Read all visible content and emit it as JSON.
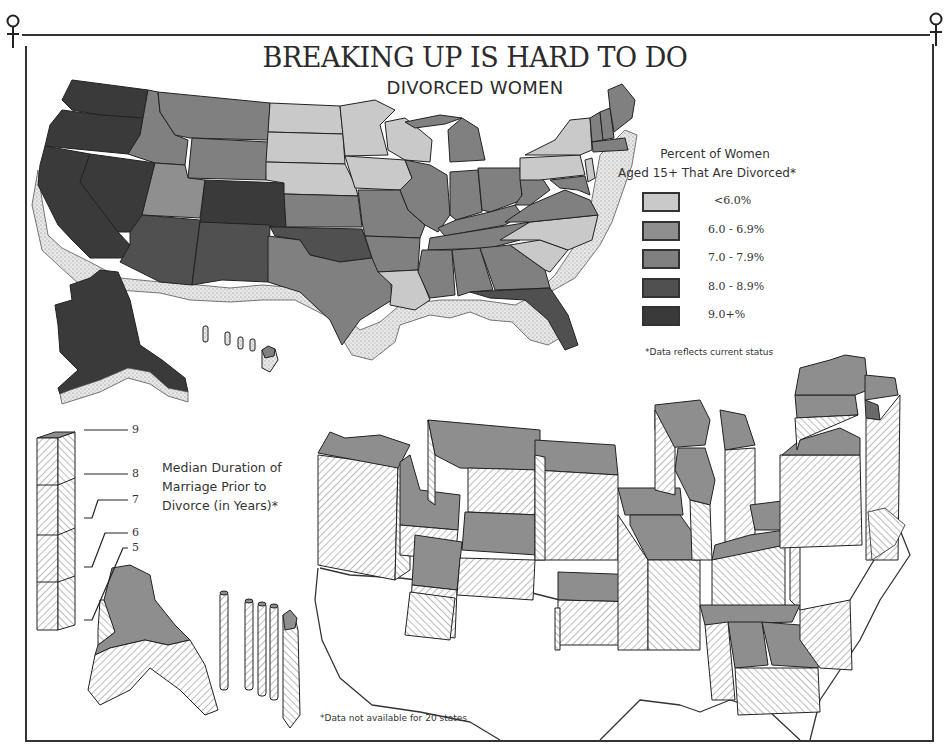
{
  "title": "BREAKING UP IS HARD TO DO",
  "subtitle": "DIVORCED WOMEN",
  "legend": {
    "title_line1": "Percent of Women",
    "title_line2": "Aged 15+ That Are Divorced*",
    "items": [
      {
        "label": "<6.0%",
        "color": "#c9c9c9"
      },
      {
        "label": "6.0 - 6.9%",
        "color": "#8f8f8f"
      },
      {
        "label": "7.0 - 7.9%",
        "color": "#808080"
      },
      {
        "label": "8.0 - 8.9%",
        "color": "#505050"
      },
      {
        "label": "9.0+%",
        "color": "#3a3a3a"
      }
    ],
    "note": "*Data reflects current status"
  },
  "duration": {
    "title_line1": "Median Duration of",
    "title_line2": "Marriage Prior to",
    "title_line3": "Divorce (in Years)*",
    "scale_ticks": [
      "9",
      "8",
      "7",
      "6",
      "5"
    ],
    "footnote": "*Data not available for 20 states"
  },
  "colors": {
    "lt6": "#c9c9c9",
    "c6": "#8f8f8f",
    "c7": "#808080",
    "c8": "#505050",
    "c9": "#3a3a3a",
    "bar_fill": "#8e8e8e",
    "frame": "#333333"
  },
  "states_divorce_category": {
    "Washington": "9.0+%",
    "Oregon": "9.0+%",
    "California": "9.0+%",
    "Nevada": "9.0+%",
    "Idaho": "7.0 - 7.9%",
    "Montana": "7.0 - 7.9%",
    "Wyoming": "7.0 - 7.9%",
    "Utah": "6.0 - 6.9%",
    "Colorado": "9.0+%",
    "Arizona": "8.0 - 8.9%",
    "New Mexico": "8.0 - 8.9%",
    "Alaska": "9.0+%",
    "North Dakota": "<6.0%",
    "South Dakota": "<6.0%",
    "Nebraska": "<6.0%",
    "Kansas": "7.0 - 7.9%",
    "Oklahoma": "8.0 - 8.9%",
    "Texas": "7.0 - 7.9%",
    "Minnesota": "<6.0%",
    "Iowa": "<6.0%",
    "Missouri": "7.0 - 7.9%",
    "Arkansas": "7.0 - 7.9%",
    "Louisiana": "<6.0%",
    "Wisconsin": "<6.0%",
    "Illinois": "7.0 - 7.9%",
    "Michigan": "7.0 - 7.9%",
    "Indiana": "7.0 - 7.9%",
    "Ohio": "7.0 - 7.9%",
    "Kentucky": "7.0 - 7.9%",
    "Tennessee": "7.0 - 7.9%",
    "Mississippi": "7.0 - 7.9%",
    "Alabama": "7.0 - 7.9%",
    "Georgia": "7.0 - 7.9%",
    "Florida": "8.0 - 8.9%",
    "South Carolina": "<6.0%",
    "North Carolina": "<6.0%",
    "Virginia": "7.0 - 7.9%",
    "West Virginia": "7.0 - 7.9%",
    "Pennsylvania": "<6.0%",
    "New York": "<6.0%",
    "New Jersey": "<6.0%",
    "Maine": "7.0 - 7.9%",
    "Vermont": "7.0 - 7.9%",
    "New Hampshire": "7.0 - 7.9%",
    "Massachusetts": "7.0 - 7.9%",
    "Hawaii": "7.0 - 7.9%"
  }
}
